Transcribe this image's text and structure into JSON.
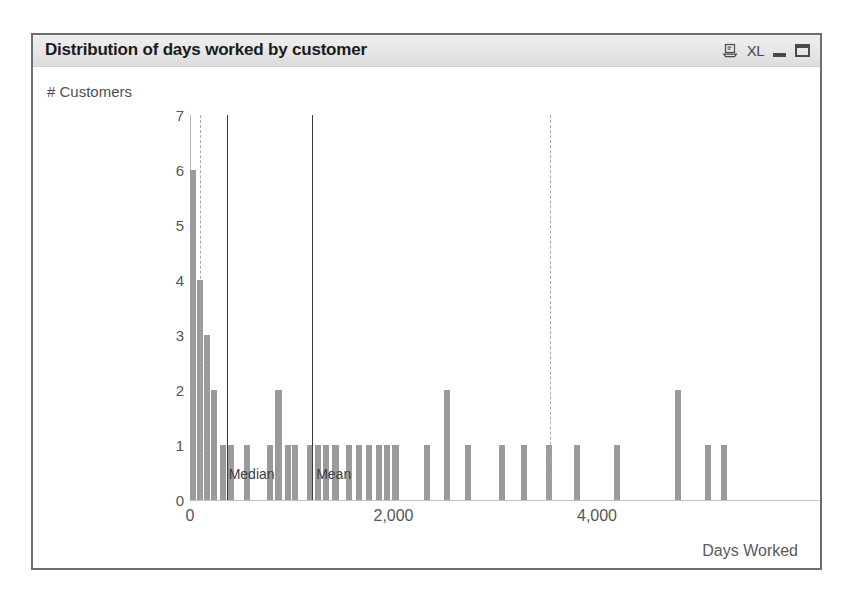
{
  "window": {
    "title": "Distribution of days worked by customer",
    "icons": [
      {
        "name": "print-clipboard-icon",
        "label": "⎙"
      },
      {
        "name": "excel-export-icon",
        "label": "XL"
      },
      {
        "name": "minimize-icon",
        "label": ""
      },
      {
        "name": "maximize-icon",
        "label": ""
      }
    ]
  },
  "chart_data": {
    "type": "bar",
    "title": "Distribution of days worked by customer",
    "xlabel": "Days Worked",
    "ylabel": "# Customers",
    "xlim": [
      -150,
      6020
    ],
    "ylim": [
      0,
      7
    ],
    "grid": false,
    "legend": null,
    "xticks": [
      "0",
      "2,000",
      "4,000"
    ],
    "xtick_values": [
      0,
      2000,
      4000
    ],
    "yticks": [
      "0",
      "1",
      "2",
      "3",
      "4",
      "5",
      "6",
      "7"
    ],
    "ytick_values": [
      0,
      1,
      2,
      3,
      4,
      5,
      6,
      7
    ],
    "bin_width_days": 60,
    "bars": [
      {
        "x": 30,
        "y": 6
      },
      {
        "x": 100,
        "y": 4
      },
      {
        "x": 170,
        "y": 3
      },
      {
        "x": 240,
        "y": 2
      },
      {
        "x": 320,
        "y": 1
      },
      {
        "x": 400,
        "y": 1
      },
      {
        "x": 560,
        "y": 1
      },
      {
        "x": 790,
        "y": 1
      },
      {
        "x": 870,
        "y": 2
      },
      {
        "x": 960,
        "y": 1
      },
      {
        "x": 1030,
        "y": 1
      },
      {
        "x": 1180,
        "y": 1
      },
      {
        "x": 1260,
        "y": 1
      },
      {
        "x": 1340,
        "y": 1
      },
      {
        "x": 1430,
        "y": 1
      },
      {
        "x": 1560,
        "y": 1
      },
      {
        "x": 1660,
        "y": 1
      },
      {
        "x": 1760,
        "y": 1
      },
      {
        "x": 1860,
        "y": 1
      },
      {
        "x": 1940,
        "y": 1
      },
      {
        "x": 2020,
        "y": 1
      },
      {
        "x": 2330,
        "y": 1
      },
      {
        "x": 2530,
        "y": 2
      },
      {
        "x": 2730,
        "y": 1
      },
      {
        "x": 3070,
        "y": 1
      },
      {
        "x": 3280,
        "y": 1
      },
      {
        "x": 3530,
        "y": 1
      },
      {
        "x": 3800,
        "y": 1
      },
      {
        "x": 4200,
        "y": 1
      },
      {
        "x": 4800,
        "y": 2
      },
      {
        "x": 5090,
        "y": 1
      },
      {
        "x": 5250,
        "y": 1
      }
    ],
    "reference_lines": [
      {
        "name": "lower-dashed",
        "x": 100,
        "style": "dashed",
        "label": ""
      },
      {
        "name": "median",
        "x": 360,
        "style": "solid",
        "label": "Median"
      },
      {
        "name": "mean",
        "x": 1200,
        "style": "solid",
        "label": "Mean"
      },
      {
        "name": "upper-dashed",
        "x": 3540,
        "style": "dashed",
        "label": ""
      }
    ],
    "annotations": [
      {
        "text": "Median",
        "x": 380
      },
      {
        "text": "Mean",
        "x": 1240
      }
    ]
  },
  "colors": {
    "bar": "#9b9b9b",
    "refline_solid": "#3a3a3a",
    "refline_dashed": "#a9a9a9",
    "axis": "#bdbdbd",
    "text": "#565656",
    "titlebar": "#e6e6e6",
    "frame": "#6e6e6e"
  }
}
